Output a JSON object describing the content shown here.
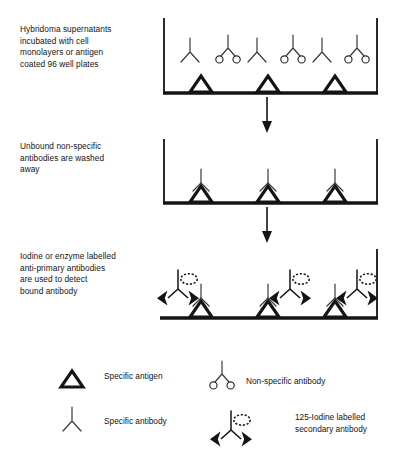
{
  "diagram": {
    "type": "process-flow",
    "colors": {
      "ink": "#141414",
      "background": "#ffffff",
      "thin_stroke": "#3a3a3a"
    },
    "steps": [
      {
        "id": "step-1",
        "caption": "Hybridoma supernatants\nincubated with  cell\nmonolayers or antigen\ncoated 96 well plates",
        "well": {
          "has_left_wall": true,
          "has_right_wall": true,
          "has_base": true
        },
        "antigen_count": 3,
        "specific_antibody_count": 3,
        "nonspecific_antibody_count": 3,
        "bound": false
      },
      {
        "id": "step-2",
        "caption": "Unbound non-specific\nantibodies are washed\naway",
        "well": {
          "has_left_wall": true,
          "has_right_wall": true,
          "has_base": true
        },
        "antigen_count": 3,
        "specific_antibody_count": 3,
        "nonspecific_antibody_count": 0,
        "bound": true
      },
      {
        "id": "step-3",
        "caption": "Iodine or enzyme labelled\nanti-primary antibodies\nare used to detect\nbound antibody",
        "well": {
          "has_left_wall": false,
          "has_right_wall": true,
          "has_base": true
        },
        "antigen_count": 3,
        "specific_antibody_count": 3,
        "nonspecific_antibody_count": 0,
        "labelled_secondary_count": 3,
        "bound": true
      }
    ],
    "arrows": [
      {
        "id": "arrow-step1-to-step2",
        "direction": "down"
      },
      {
        "id": "arrow-step2-to-step3",
        "direction": "down"
      }
    ],
    "legend": {
      "entries": [
        {
          "id": "specific-antigen",
          "symbol": "triangle-outline",
          "label": "Specific antigen"
        },
        {
          "id": "specific-antibody",
          "symbol": "y-shape",
          "label": "Specific antibody"
        },
        {
          "id": "nonspecific-antibody",
          "symbol": "y-shape-with-circles",
          "label": "Non-specific antibody"
        },
        {
          "id": "secondary-antibody",
          "symbol": "y-shape-with-arrowheads-and-starburst",
          "label": "125-Iodine labelled\nsecondary antibody"
        }
      ]
    }
  }
}
